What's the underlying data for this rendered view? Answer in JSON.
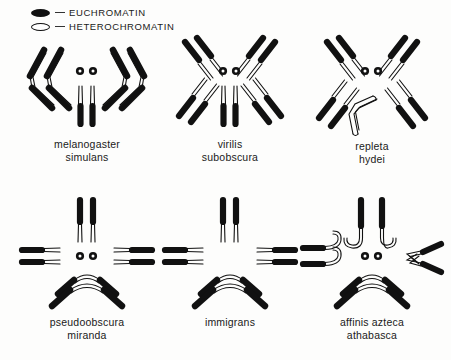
{
  "figure": {
    "background_color": "#fdfdfc",
    "ink_color": "#111111"
  },
  "legend": {
    "items": [
      {
        "symbol": "filled-ellipse",
        "label": "EUCHROMATIN",
        "fill": "#111111"
      },
      {
        "symbol": "open-ellipse",
        "label": "HETEROCHROMATIN",
        "fill": "#ffffff"
      }
    ]
  },
  "groups": [
    {
      "id": "melanogaster",
      "names": [
        "melanogaster",
        "simulans"
      ],
      "arrangement": "two-metacentric-V-pairs-plus-dots-plus-rod-pair",
      "dot_chromosomes": 2,
      "center_rods": 2,
      "v_pairs": 2
    },
    {
      "id": "virilis",
      "names": [
        "virilis",
        "subobscura"
      ],
      "arrangement": "four-radial-rod-pairs-plus-dots-plus-rod-pair",
      "dot_chromosomes": 2,
      "center_rods": 2,
      "rod_pairs": 4
    },
    {
      "id": "repleta",
      "names": [
        "repleta",
        "hydei"
      ],
      "arrangement": "four-radial-rod-pairs-plus-dots-plus-heterochromatic-V",
      "dot_chromosomes": 2,
      "rod_pairs": 4,
      "heterochromatic_v": 1
    },
    {
      "id": "pseudoobscura",
      "names": [
        "pseudoobscura",
        "miranda"
      ],
      "arrangement": "vertical-rod-pair-plus-lateral-rod-pairs-plus-dots-plus-V-pair",
      "dot_chromosomes": 2,
      "vertical_rods": 2,
      "lateral_rod_pairs": 2,
      "v_pairs": 2
    },
    {
      "id": "immigrans",
      "names": [
        "immigrans"
      ],
      "arrangement": "vertical-rod-pair-plus-lateral-rod-pairs-plus-V-pair",
      "dot_chromosomes": 0,
      "vertical_rods": 2,
      "lateral_rod_pairs": 2,
      "v_pairs": 2
    },
    {
      "id": "affinis",
      "names": [
        "affinis azteca",
        "athabasca"
      ],
      "arrangement": "hooked-J-chromosomes-plus-dots-plus-V-pair",
      "dot_chromosomes": 2,
      "hooked_rods": 6,
      "v_pairs": 2
    }
  ]
}
